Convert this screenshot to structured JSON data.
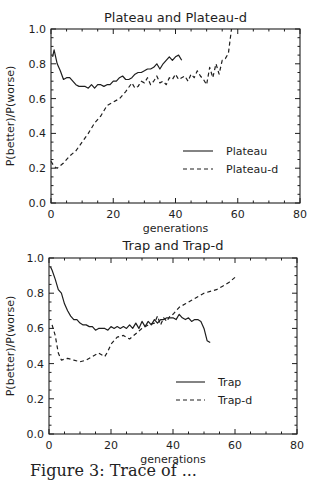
{
  "figure": {
    "caption": "Figure 3: Trace of ..."
  },
  "chart_data": [
    {
      "type": "line",
      "title": "Plateau and Plateau-d",
      "xlabel": "generations",
      "ylabel": "P(better)/P(worse)",
      "xlim": [
        0,
        80
      ],
      "ylim": [
        0.0,
        1.0
      ],
      "xticks": [
        "0",
        "20",
        "40",
        "60",
        "80"
      ],
      "yticks": [
        "0.0",
        "0.2",
        "0.4",
        "0.6",
        "0.8",
        "1.0"
      ],
      "grid": false,
      "legend_position": "lower right",
      "series": [
        {
          "name": "Plateau",
          "style": "solid",
          "x": [
            0.5,
            1,
            2,
            3,
            4,
            5,
            6,
            7,
            8,
            9,
            10,
            11,
            12,
            13,
            14,
            15,
            16,
            17,
            18,
            19,
            20,
            21,
            22,
            23,
            24,
            25,
            26,
            27,
            28,
            29,
            30,
            31,
            32,
            33,
            34,
            35,
            36,
            37,
            38,
            39,
            40,
            41,
            42
          ],
          "y": [
            0.84,
            0.88,
            0.8,
            0.76,
            0.71,
            0.72,
            0.72,
            0.7,
            0.68,
            0.67,
            0.67,
            0.67,
            0.66,
            0.68,
            0.66,
            0.68,
            0.68,
            0.67,
            0.68,
            0.68,
            0.7,
            0.7,
            0.72,
            0.73,
            0.71,
            0.71,
            0.72,
            0.74,
            0.75,
            0.75,
            0.76,
            0.77,
            0.77,
            0.78,
            0.8,
            0.77,
            0.8,
            0.82,
            0.84,
            0.82,
            0.84,
            0.85,
            0.82
          ]
        },
        {
          "name": "Plateau-d",
          "style": "dashed",
          "x": [
            0,
            1,
            2,
            4,
            6,
            8,
            10,
            12,
            14,
            16,
            18,
            20,
            22,
            24,
            26,
            27,
            28,
            29,
            30,
            31,
            32,
            33,
            34,
            35,
            36,
            37,
            38,
            39,
            40,
            41,
            42,
            43,
            44,
            45,
            46,
            47,
            48,
            49,
            50,
            51,
            52,
            53,
            54,
            55,
            56,
            57,
            58
          ],
          "y": [
            0.24,
            0.21,
            0.2,
            0.23,
            0.27,
            0.3,
            0.35,
            0.4,
            0.46,
            0.5,
            0.56,
            0.58,
            0.6,
            0.64,
            0.69,
            0.66,
            0.67,
            0.7,
            0.69,
            0.72,
            0.68,
            0.7,
            0.73,
            0.69,
            0.7,
            0.68,
            0.72,
            0.71,
            0.74,
            0.71,
            0.72,
            0.73,
            0.7,
            0.74,
            0.72,
            0.76,
            0.73,
            0.71,
            0.68,
            0.78,
            0.72,
            0.8,
            0.74,
            0.82,
            0.83,
            0.86,
            1.0
          ]
        }
      ]
    },
    {
      "type": "line",
      "title": "Trap and Trap-d",
      "xlabel": "generations",
      "ylabel": "P(better)/P(worse)",
      "xlim": [
        0,
        80
      ],
      "ylim": [
        0.0,
        1.0
      ],
      "xticks": [
        "0",
        "20",
        "40",
        "60",
        "80"
      ],
      "yticks": [
        "0.0",
        "0.2",
        "0.4",
        "0.6",
        "0.8",
        "1.0"
      ],
      "grid": false,
      "legend_position": "lower right",
      "series": [
        {
          "name": "Trap",
          "style": "solid",
          "x": [
            0.5,
            1,
            2,
            3,
            4,
            5,
            6,
            7,
            8,
            9,
            10,
            11,
            12,
            13,
            14,
            15,
            16,
            17,
            18,
            19,
            20,
            21,
            22,
            23,
            24,
            25,
            26,
            27,
            28,
            29,
            30,
            31,
            32,
            33,
            34,
            35,
            36,
            37,
            38,
            39,
            40,
            41,
            42,
            43,
            44,
            45,
            46,
            47,
            48,
            49,
            50,
            51,
            52
          ],
          "y": [
            0.95,
            0.93,
            0.88,
            0.82,
            0.8,
            0.74,
            0.7,
            0.67,
            0.65,
            0.65,
            0.63,
            0.62,
            0.62,
            0.61,
            0.61,
            0.59,
            0.6,
            0.6,
            0.6,
            0.59,
            0.61,
            0.6,
            0.61,
            0.6,
            0.61,
            0.6,
            0.62,
            0.6,
            0.63,
            0.6,
            0.64,
            0.61,
            0.64,
            0.62,
            0.65,
            0.63,
            0.65,
            0.65,
            0.66,
            0.66,
            0.66,
            0.65,
            0.68,
            0.66,
            0.65,
            0.66,
            0.64,
            0.65,
            0.65,
            0.64,
            0.6,
            0.53,
            0.52
          ]
        },
        {
          "name": "Trap-d",
          "style": "dashed",
          "x": [
            1,
            2,
            3,
            4,
            6,
            8,
            10,
            12,
            14,
            16,
            18,
            19,
            20,
            22,
            24,
            26,
            28,
            30,
            32,
            34,
            35,
            36,
            37,
            38,
            39,
            40,
            42,
            44,
            46,
            48,
            50,
            52,
            54,
            56,
            58,
            60
          ],
          "y": [
            0.62,
            0.56,
            0.46,
            0.42,
            0.43,
            0.42,
            0.41,
            0.42,
            0.44,
            0.46,
            0.44,
            0.47,
            0.51,
            0.55,
            0.56,
            0.54,
            0.57,
            0.6,
            0.62,
            0.63,
            0.67,
            0.62,
            0.66,
            0.64,
            0.67,
            0.68,
            0.72,
            0.74,
            0.76,
            0.78,
            0.8,
            0.81,
            0.82,
            0.84,
            0.86,
            0.89
          ]
        }
      ]
    }
  ],
  "plots": [
    {
      "frame": {
        "left": 51,
        "top": 29,
        "right": 300,
        "bottom": 203
      },
      "title_y": 22,
      "xlabel_y": 232,
      "legend": {
        "x1": 183,
        "x2": 213,
        "text_x": 226,
        "y_solid": 151,
        "y_dashed": 169
      }
    },
    {
      "frame": {
        "left": 49,
        "top": 258,
        "right": 297,
        "bottom": 434
      },
      "title_y": 250,
      "xlabel_y": 463,
      "legend": {
        "x1": 176,
        "x2": 205,
        "text_x": 218,
        "y_solid": 382,
        "y_dashed": 400
      }
    }
  ]
}
